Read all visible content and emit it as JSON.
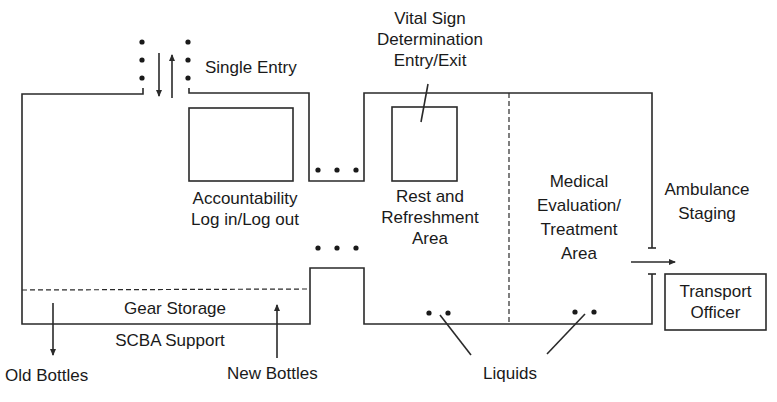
{
  "diagram": {
    "labels": {
      "single_entry": "Single Entry",
      "vital_sign": [
        "Vital Sign",
        "Determination",
        "Entry/Exit"
      ],
      "accountability": [
        "Accountability",
        "Log in/Log out"
      ],
      "rest_area": [
        "Rest and",
        "Refreshment",
        "Area"
      ],
      "medical_area": [
        "Medical",
        "Evaluation/",
        "Treatment",
        "Area"
      ],
      "ambulance_staging": [
        "Ambulance",
        "Staging"
      ],
      "transport_officer": [
        "Transport",
        "Officer"
      ],
      "gear_storage": "Gear Storage",
      "scba_support": "SCBA Support",
      "old_bottles": "Old Bottles",
      "new_bottles": "New Bottles",
      "liquids": "Liquids"
    },
    "colors": {
      "line": "#2a2a2a",
      "text": "#1a1a1a",
      "background": "#ffffff"
    }
  }
}
